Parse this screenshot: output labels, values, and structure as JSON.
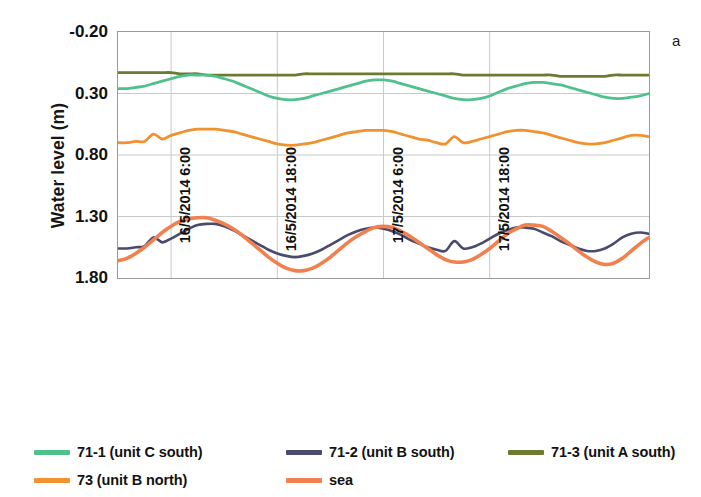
{
  "panel_label": "a",
  "axes": {
    "ylabel": "Water level (m)",
    "yticks": [
      "1.80",
      "1.30",
      "0.80",
      "0.30",
      "-0.20"
    ],
    "xticks": [
      "16/5/2014 6:00",
      "16/5/2014 18:00",
      "17/5/2014 6:00",
      "17/5/2014 18:00"
    ]
  },
  "legend": {
    "items": [
      {
        "label": "71-1 (unit C south)",
        "color": "#4FC18C"
      },
      {
        "label": "71-2 (unit B south)",
        "color": "#4A4A6E"
      },
      {
        "label": "71-3 (unit A south)",
        "color": "#6B7B32"
      },
      {
        "label": "73 (unit  B north)",
        "color": "#F0922F"
      },
      {
        "label": "sea",
        "color": "#F2804E"
      }
    ]
  },
  "chart_data": {
    "type": "line",
    "title": "",
    "xlabel": "",
    "ylabel": "Water level (m)",
    "ylim": [
      -0.2,
      1.8
    ],
    "yticks": [
      -0.2,
      0.3,
      0.8,
      1.3,
      1.8
    ],
    "xlim": [
      0,
      60
    ],
    "grid": true,
    "legend_position": "bottom",
    "x_unit": "hours from 16/5/2014 0:00",
    "xtick_values": [
      6,
      18,
      30,
      42
    ],
    "xtick_labels": [
      "16/5/2014 6:00",
      "16/5/2014 18:00",
      "17/5/2014 6:00",
      "17/5/2014 18:00"
    ],
    "x": [
      0,
      1,
      2,
      3,
      4,
      5,
      6,
      7,
      8,
      9,
      10,
      11,
      12,
      13,
      14,
      15,
      16,
      17,
      18,
      19,
      20,
      21,
      22,
      23,
      24,
      25,
      26,
      27,
      28,
      29,
      30,
      31,
      32,
      33,
      34,
      35,
      36,
      37,
      38,
      39,
      40,
      41,
      42,
      43,
      44,
      45,
      46,
      47,
      48,
      49,
      50,
      51,
      52,
      53,
      54,
      55,
      56,
      57,
      58,
      59,
      60
    ],
    "series": [
      {
        "name": "71-1 (unit C south)",
        "color": "#4FC18C",
        "values": [
          1.34,
          1.34,
          1.35,
          1.36,
          1.38,
          1.4,
          1.42,
          1.44,
          1.45,
          1.45,
          1.45,
          1.44,
          1.42,
          1.4,
          1.37,
          1.34,
          1.31,
          1.28,
          1.26,
          1.25,
          1.25,
          1.26,
          1.28,
          1.3,
          1.32,
          1.34,
          1.36,
          1.38,
          1.4,
          1.41,
          1.41,
          1.4,
          1.38,
          1.36,
          1.34,
          1.32,
          1.3,
          1.28,
          1.26,
          1.25,
          1.25,
          1.26,
          1.28,
          1.31,
          1.34,
          1.36,
          1.38,
          1.39,
          1.39,
          1.38,
          1.37,
          1.35,
          1.33,
          1.31,
          1.29,
          1.27,
          1.26,
          1.26,
          1.27,
          1.28,
          1.3
        ]
      },
      {
        "name": "71-2 (unit B south)",
        "color": "#4A4A6E",
        "values": [
          0.04,
          0.04,
          0.05,
          0.06,
          0.13,
          0.09,
          0.12,
          0.16,
          0.2,
          0.23,
          0.24,
          0.24,
          0.22,
          0.19,
          0.15,
          0.11,
          0.07,
          0.03,
          0.0,
          -0.02,
          -0.03,
          -0.02,
          0.0,
          0.03,
          0.07,
          0.11,
          0.15,
          0.18,
          0.2,
          0.21,
          0.2,
          0.18,
          0.15,
          0.11,
          0.08,
          0.05,
          0.03,
          0.02,
          0.1,
          0.04,
          0.05,
          0.08,
          0.12,
          0.16,
          0.19,
          0.21,
          0.21,
          0.2,
          0.17,
          0.14,
          0.1,
          0.07,
          0.04,
          0.02,
          0.02,
          0.04,
          0.08,
          0.13,
          0.16,
          0.17,
          0.16
        ]
      },
      {
        "name": "71-3 (unit A south)",
        "color": "#6B7B32",
        "values": [
          1.47,
          1.47,
          1.47,
          1.47,
          1.47,
          1.47,
          1.47,
          1.46,
          1.46,
          1.46,
          1.45,
          1.45,
          1.45,
          1.45,
          1.45,
          1.45,
          1.45,
          1.45,
          1.45,
          1.45,
          1.45,
          1.46,
          1.46,
          1.46,
          1.46,
          1.46,
          1.46,
          1.46,
          1.46,
          1.46,
          1.46,
          1.46,
          1.46,
          1.46,
          1.46,
          1.46,
          1.46,
          1.46,
          1.46,
          1.45,
          1.45,
          1.45,
          1.45,
          1.45,
          1.45,
          1.45,
          1.45,
          1.45,
          1.45,
          1.45,
          1.44,
          1.44,
          1.44,
          1.44,
          1.44,
          1.44,
          1.45,
          1.45,
          1.45,
          1.45,
          1.45
        ]
      },
      {
        "name": "73 (unit  B north)",
        "color": "#F0922F",
        "values": [
          0.9,
          0.9,
          0.91,
          0.91,
          0.97,
          0.93,
          0.96,
          0.98,
          1.0,
          1.01,
          1.01,
          1.01,
          1.0,
          0.99,
          0.97,
          0.95,
          0.93,
          0.91,
          0.89,
          0.88,
          0.88,
          0.89,
          0.9,
          0.92,
          0.94,
          0.96,
          0.98,
          0.99,
          1.0,
          1.0,
          1.0,
          0.99,
          0.97,
          0.95,
          0.93,
          0.92,
          0.9,
          0.89,
          0.95,
          0.9,
          0.91,
          0.93,
          0.95,
          0.97,
          0.99,
          1.0,
          1.0,
          0.99,
          0.98,
          0.96,
          0.94,
          0.92,
          0.9,
          0.89,
          0.89,
          0.9,
          0.92,
          0.94,
          0.96,
          0.96,
          0.95
        ]
      },
      {
        "name": "sea",
        "color": "#F2804E",
        "values": [
          -0.06,
          -0.04,
          0.0,
          0.05,
          0.11,
          0.17,
          0.22,
          0.26,
          0.28,
          0.29,
          0.29,
          0.27,
          0.24,
          0.2,
          0.15,
          0.09,
          0.03,
          -0.03,
          -0.08,
          -0.12,
          -0.14,
          -0.14,
          -0.12,
          -0.08,
          -0.03,
          0.03,
          0.09,
          0.14,
          0.18,
          0.21,
          0.22,
          0.21,
          0.18,
          0.14,
          0.09,
          0.04,
          -0.01,
          -0.05,
          -0.07,
          -0.07,
          -0.05,
          -0.01,
          0.04,
          0.1,
          0.16,
          0.2,
          0.23,
          0.23,
          0.22,
          0.18,
          0.13,
          0.08,
          0.02,
          -0.03,
          -0.07,
          -0.09,
          -0.08,
          -0.04,
          0.02,
          0.08,
          0.13
        ]
      }
    ]
  }
}
